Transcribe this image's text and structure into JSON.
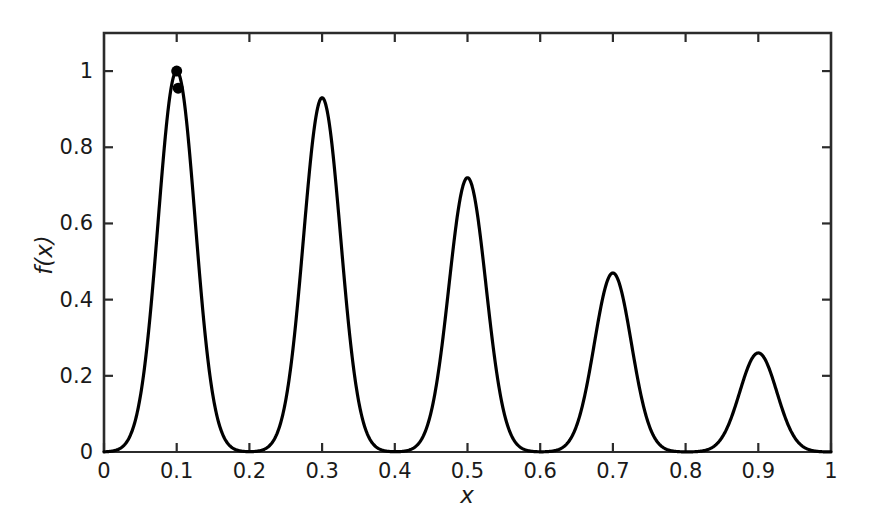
{
  "chart_data": {
    "type": "line",
    "title": "",
    "subtitle": "",
    "xlabel": "x",
    "ylabel": "f(x)",
    "xlim": [
      0,
      1
    ],
    "ylim": [
      0,
      1.1
    ],
    "grid": false,
    "legend": null,
    "legend_position": "none",
    "x_ticks": [
      0,
      0.1,
      0.2,
      0.3,
      0.4,
      0.5,
      0.6,
      0.7,
      0.8,
      0.9,
      1
    ],
    "x_tick_labels": [
      "0",
      "0.1",
      "0.2",
      "0.3",
      "0.4",
      "0.5",
      "0.6",
      "0.7",
      "0.8",
      "0.9",
      "1"
    ],
    "y_ticks": [
      0,
      0.2,
      0.4,
      0.6,
      0.8,
      1
    ],
    "y_tick_labels": [
      "0",
      "0.2",
      "0.4",
      "0.6",
      "0.8",
      "1"
    ],
    "line_color": "#000000",
    "line_width": 3.2,
    "series": [
      {
        "name": "f(x)",
        "description": "Sum of five Gaussian peaks with decreasing amplitude",
        "peaks": [
          {
            "center": 0.1,
            "amplitude": 1.0,
            "sigma": 0.0255
          },
          {
            "center": 0.3,
            "amplitude": 0.93,
            "sigma": 0.0255
          },
          {
            "center": 0.5,
            "amplitude": 0.72,
            "sigma": 0.0255
          },
          {
            "center": 0.7,
            "amplitude": 0.47,
            "sigma": 0.0255
          },
          {
            "center": 0.9,
            "amplitude": 0.26,
            "sigma": 0.0255
          }
        ]
      }
    ],
    "markers": {
      "shape": "circle",
      "color": "#000000",
      "size": 11,
      "points": [
        {
          "x": 0.1,
          "y": 1.0
        },
        {
          "x": 0.102,
          "y": 0.955
        }
      ]
    }
  },
  "axes": {
    "x_title": "x",
    "y_title": "f(x)"
  }
}
